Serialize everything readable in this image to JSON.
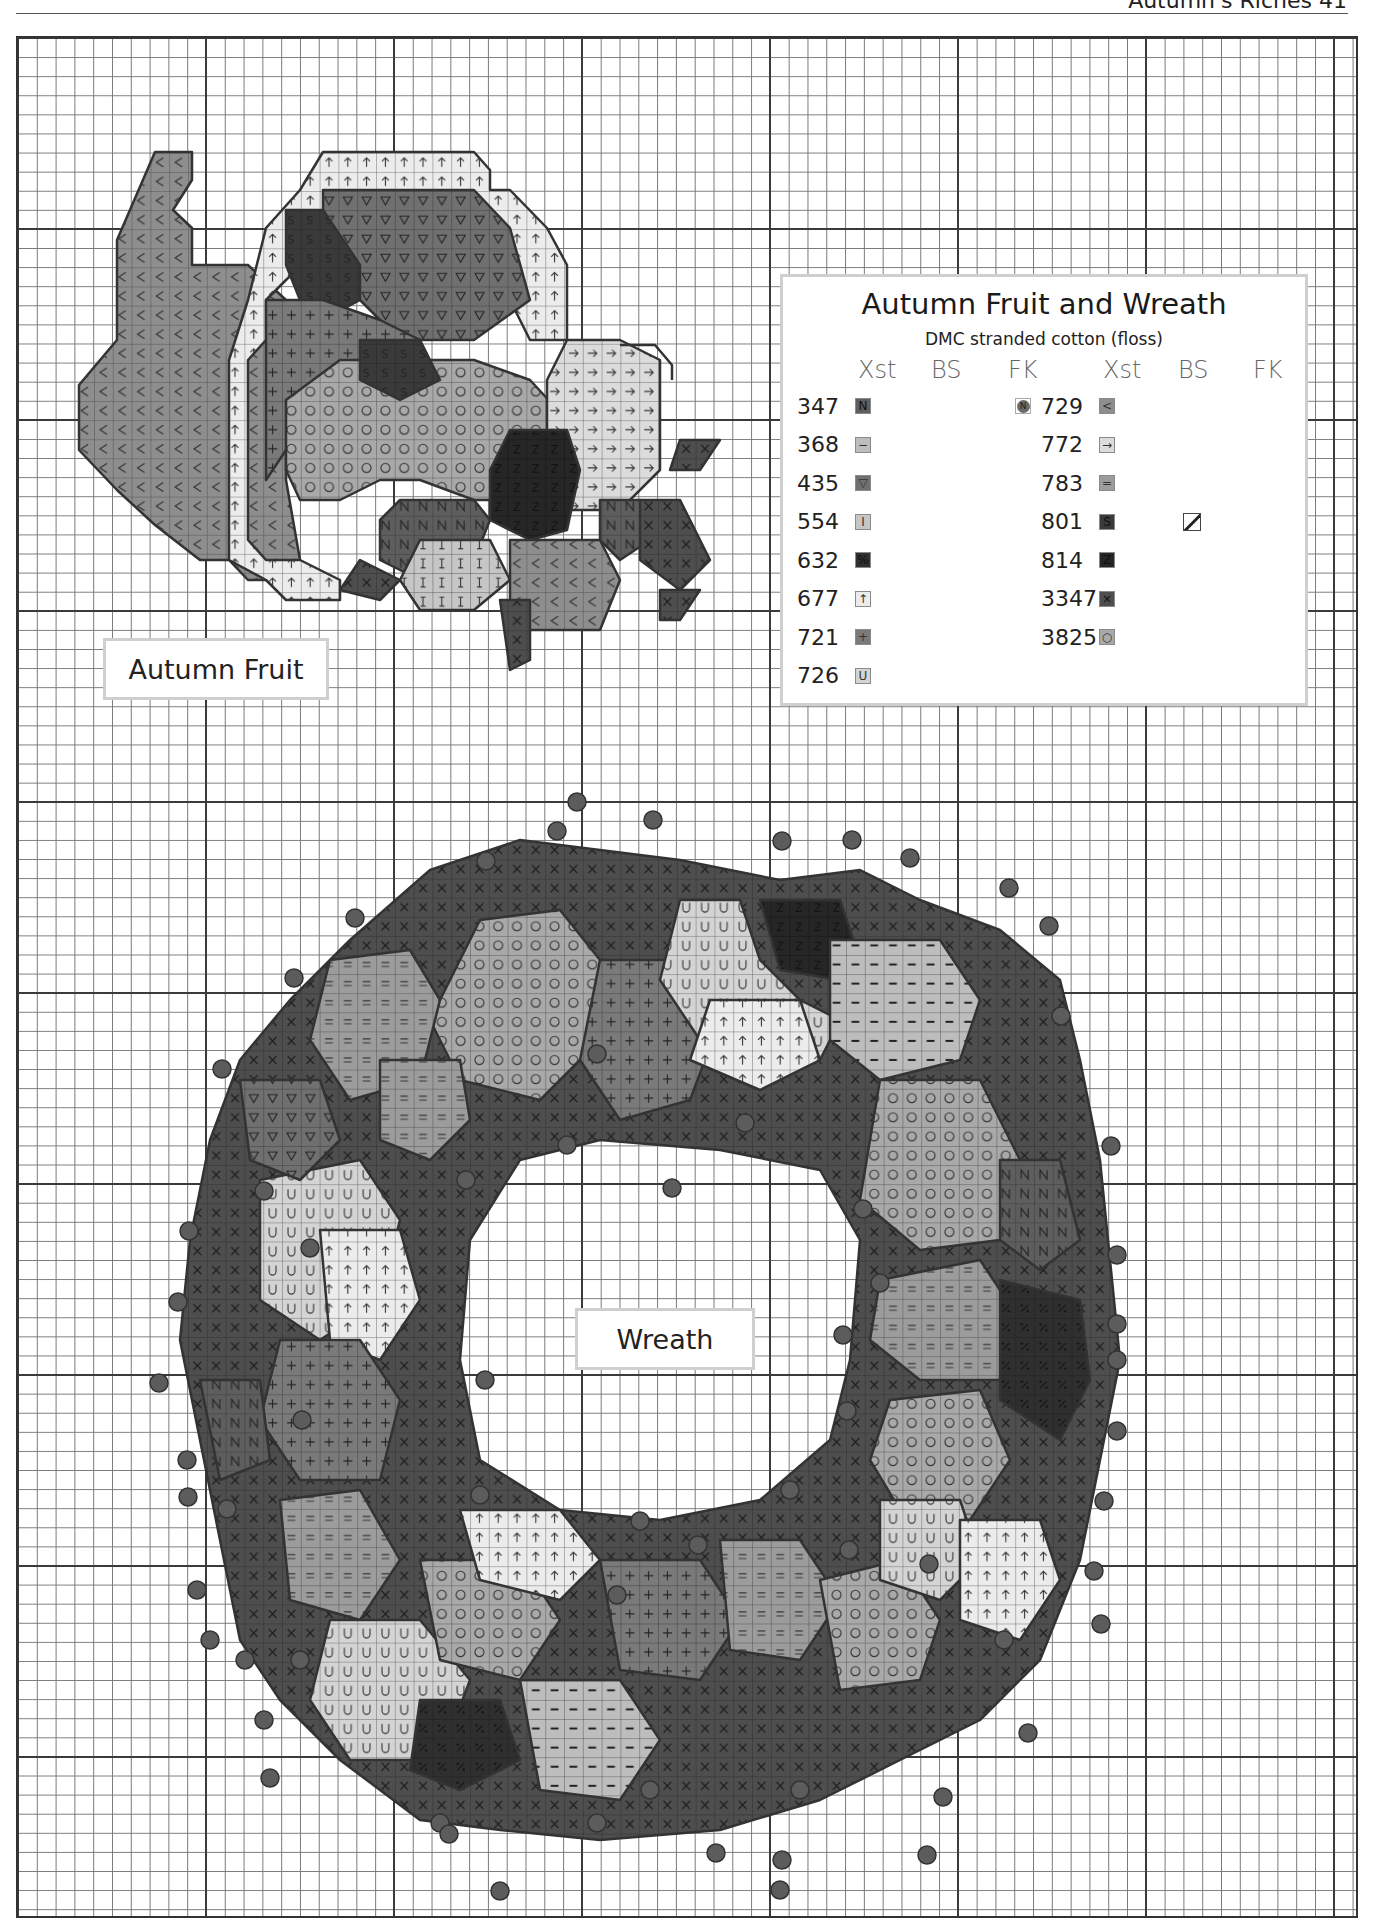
{
  "page": {
    "running_head": "Autumn's Riches 41"
  },
  "labels": {
    "fruit": "Autumn Fruit",
    "wreath": "Wreath"
  },
  "key": {
    "title": "Autumn Fruit and Wreath",
    "subtitle": "DMC stranded cotton (floss)",
    "columns": [
      "Xst",
      "BS",
      "FK",
      "Xst",
      "BS",
      "FK"
    ],
    "left": [
      {
        "dmc": "347",
        "symbol": "N",
        "color": "#5e5e5e",
        "fk": true,
        "fk_symbol": "N"
      },
      {
        "dmc": "368",
        "symbol": "−",
        "color": "#bdbdbd"
      },
      {
        "dmc": "435",
        "symbol": "▽",
        "color": "#707070"
      },
      {
        "dmc": "554",
        "symbol": "I",
        "color": "#c6c6c6"
      },
      {
        "dmc": "632",
        "symbol": "%",
        "color": "#2f2f2f"
      },
      {
        "dmc": "677",
        "symbol": "↑",
        "color": "#ececec"
      },
      {
        "dmc": "721",
        "symbol": "+",
        "color": "#7a7a7a"
      },
      {
        "dmc": "726",
        "symbol": "U",
        "color": "#d4d4d4"
      }
    ],
    "right": [
      {
        "dmc": "729",
        "symbol": "<",
        "color": "#8e8e8e"
      },
      {
        "dmc": "772",
        "symbol": "→",
        "color": "#dcdcdc"
      },
      {
        "dmc": "783",
        "symbol": "=",
        "color": "#9c9c9c"
      },
      {
        "dmc": "801",
        "symbol": "S",
        "color": "#3a3a3a",
        "bs": true
      },
      {
        "dmc": "814",
        "symbol": "Z",
        "color": "#262626"
      },
      {
        "dmc": "3347",
        "symbol": "×",
        "color": "#4e4e4e"
      },
      {
        "dmc": "3825",
        "symbol": "○",
        "color": "#a9a9a9"
      }
    ]
  },
  "colors": {
    "grid_minor": "#7a7a7a",
    "grid_major": "#3a3a3a",
    "label_border": "#cfcfcf",
    "bead": "#5c5c5c"
  }
}
